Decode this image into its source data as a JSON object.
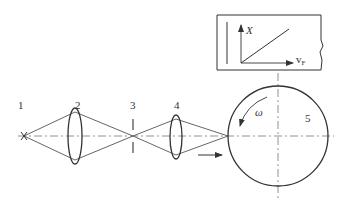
{
  "diagram": {
    "components": [
      {
        "id": "1",
        "label": "1",
        "role": "light-source"
      },
      {
        "id": "2",
        "label": "2",
        "role": "lens"
      },
      {
        "id": "3",
        "label": "3",
        "role": "aperture"
      },
      {
        "id": "4",
        "label": "4",
        "role": "lens"
      },
      {
        "id": "5",
        "label": "5",
        "role": "rotating-disk"
      }
    ],
    "rotation_label": "ω",
    "inset_graph": {
      "y_axis_label": "X",
      "x_axis_label_main": "v",
      "x_axis_label_sub": "F",
      "relation": "linear"
    },
    "colors": {
      "ink": "#333333",
      "background": "#ffffff"
    }
  }
}
